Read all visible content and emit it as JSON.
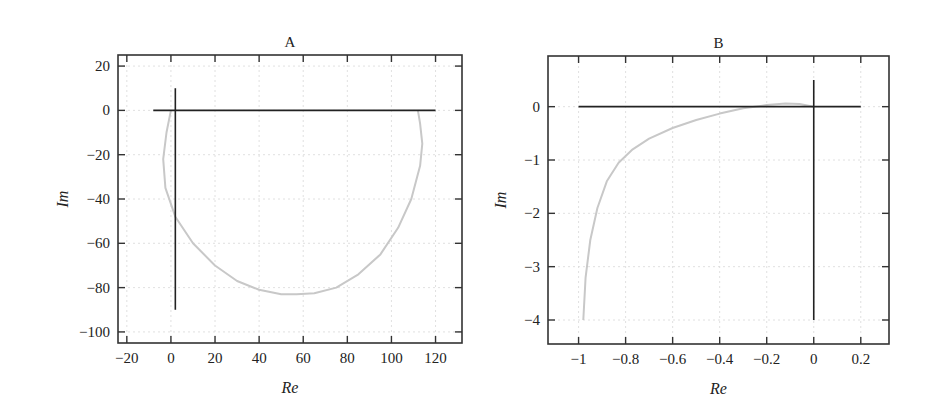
{
  "chart_data": [
    {
      "type": "line",
      "title": "A",
      "xlabel": "Re",
      "ylabel": "Im",
      "xlim": [
        -24,
        132
      ],
      "ylim": [
        -105,
        25
      ],
      "xticks": [
        -20,
        0,
        20,
        40,
        60,
        80,
        100,
        120
      ],
      "yticks": [
        20,
        0,
        -20,
        -40,
        -60,
        -80,
        -100
      ],
      "xtick_labels": [
        "−20",
        "0",
        "20",
        "40",
        "60",
        "80",
        "100",
        "120"
      ],
      "ytick_labels": [
        "20",
        "0",
        "−20",
        "−40",
        "−60",
        "−80",
        "−100"
      ],
      "grid": true,
      "axes_lines": [
        {
          "name": "real-axis",
          "x": [
            -8,
            120
          ],
          "y": [
            0,
            0
          ],
          "color": "#222222"
        },
        {
          "name": "imag-axis",
          "x": [
            2,
            2
          ],
          "y": [
            10,
            -90
          ],
          "color": "#222222"
        }
      ],
      "series": [
        {
          "name": "nyquist-curve",
          "color": "#c8c8c8",
          "x": [
            0,
            -2,
            -3.5,
            -2.5,
            2,
            10,
            20,
            30,
            40,
            50,
            57,
            65,
            75,
            85,
            95,
            103,
            109,
            113,
            114,
            113,
            112
          ],
          "y": [
            0,
            -10,
            -22,
            -35,
            -48,
            -60,
            -70,
            -77,
            -81,
            -83,
            -83,
            -82.5,
            -80,
            -74,
            -65,
            -53,
            -40,
            -25,
            -15,
            -6,
            0
          ]
        }
      ]
    },
    {
      "type": "line",
      "title": "B",
      "xlabel": "Re",
      "ylabel": "Im",
      "xlim": [
        -1.13,
        0.32
      ],
      "ylim": [
        -4.45,
        0.95
      ],
      "xticks": [
        -1,
        -0.8,
        -0.6,
        -0.4,
        -0.2,
        0,
        0.2
      ],
      "yticks": [
        0,
        -1,
        -2,
        -3,
        -4
      ],
      "xtick_labels": [
        "−1",
        "−0.8",
        "−0.6",
        "−0.4",
        "−0.2",
        "0",
        "0.2"
      ],
      "ytick_labels": [
        "0",
        "−1",
        "−2",
        "−3",
        "−4"
      ],
      "grid": true,
      "axes_lines": [
        {
          "name": "real-axis",
          "x": [
            -1,
            0.2
          ],
          "y": [
            0,
            0
          ],
          "color": "#222222"
        },
        {
          "name": "imag-axis",
          "x": [
            0,
            0
          ],
          "y": [
            0.5,
            -4
          ],
          "color": "#222222"
        }
      ],
      "series": [
        {
          "name": "nyquist-curve",
          "color": "#c8c8c8",
          "x": [
            -0.98,
            -0.97,
            -0.95,
            -0.92,
            -0.88,
            -0.83,
            -0.77,
            -0.7,
            -0.6,
            -0.5,
            -0.4,
            -0.3,
            -0.2,
            -0.12,
            -0.06,
            0
          ],
          "y": [
            -4,
            -3.2,
            -2.5,
            -1.9,
            -1.4,
            -1.05,
            -0.8,
            -0.6,
            -0.4,
            -0.25,
            -0.13,
            -0.03,
            0.03,
            0.06,
            0.05,
            0
          ]
        }
      ]
    }
  ],
  "panels": [
    {
      "title": "A",
      "xlabel": "Re",
      "ylabel": "Im"
    },
    {
      "title": "B",
      "xlabel": "Re",
      "ylabel": "Im"
    }
  ]
}
